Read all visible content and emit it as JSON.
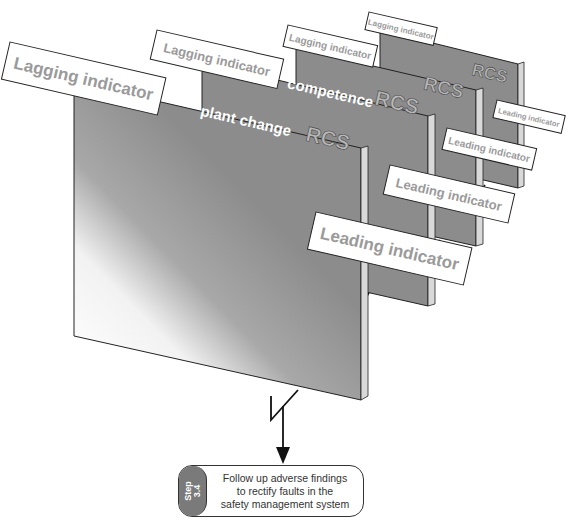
{
  "diagram": {
    "planes": [
      {
        "id": "plane-1",
        "title": "plant change",
        "tag": "RCS",
        "lagging_label": "Lagging indicator",
        "leading_label": "Leading indicator"
      },
      {
        "id": "plane-2",
        "title": "competence",
        "tag": "RCS",
        "lagging_label": "Lagging indicator",
        "leading_label": "Leading indicator"
      },
      {
        "id": "plane-3",
        "title": "",
        "tag": "RCS",
        "lagging_label": "Lagging indicator",
        "leading_label": "Leading indicator"
      },
      {
        "id": "plane-4",
        "title": "",
        "tag": "RCS",
        "lagging_label": "Lagging indicator",
        "leading_label": "Leading indicator"
      }
    ],
    "step": {
      "tab_line1": "Step",
      "tab_line2": "3.4",
      "text_line1": "Follow up adverse findings",
      "text_line2": "to rectify faults in the",
      "text_line3": "safety management system"
    },
    "colors": {
      "plane_fill": "#8c8c8c",
      "plane_edge": "#d9d9d9",
      "label_text": "#9a9a9a",
      "step_tab": "#7a7a7a",
      "outline": "#222222"
    }
  }
}
